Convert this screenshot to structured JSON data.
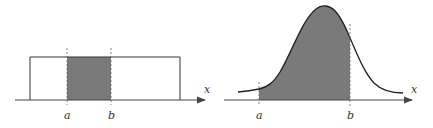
{
  "figures": [
    {
      "name": "uniform-distribution",
      "shape": "rectangle",
      "axis_label": "x",
      "bound_labels": {
        "a": "a",
        "b": "b"
      },
      "shaded_region": "between a and b"
    },
    {
      "name": "normal-distribution",
      "shape": "bell-curve",
      "axis_label": "x",
      "bound_labels": {
        "a": "a",
        "b": "b"
      },
      "shaded_region": "between a and b"
    }
  ],
  "colors": {
    "fill": "#7a7a7a",
    "line": "#222222",
    "axis": "#444444",
    "dashed": "#666666"
  }
}
